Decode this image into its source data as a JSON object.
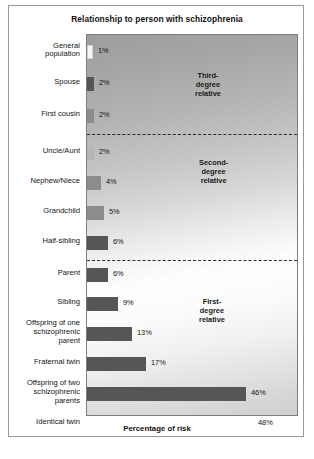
{
  "figure": {
    "title": "Relationship to person with schizophrenia",
    "x_axis_caption": "Percentage of risk"
  },
  "groups": [
    {
      "id": "third-degree",
      "label": "Third-\ndegree\nrelative"
    },
    {
      "id": "second-degree",
      "label": "Second-\ndegree\nrelative"
    },
    {
      "id": "first-degree",
      "label": "First-\ndegree\nrelative"
    }
  ],
  "chart_data": {
    "type": "bar",
    "orientation": "horizontal",
    "title": "Relationship to person with schizophrenia",
    "xlabel": "Percentage of risk",
    "ylabel": "",
    "xlim": [
      0,
      50
    ],
    "grid": false,
    "legend": "none",
    "value_suffix": "%",
    "categories": [
      "General population",
      "Spouse",
      "First cousin",
      "Uncle/Aunt",
      "Nephew/Niece",
      "Grandchild",
      "Half-sibling",
      "Parent",
      "Sibling",
      "Offspring of one schizophrenic parent",
      "Fraternal twin",
      "Offspring of two schizophrenic parents",
      "Identical twin"
    ],
    "values": [
      1,
      2,
      2,
      2,
      4,
      5,
      6,
      6,
      9,
      13,
      17,
      46,
      48
    ],
    "value_labels": [
      "1%",
      "2%",
      "2%",
      "2%",
      "4%",
      "5%",
      "6%",
      "6%",
      "9%",
      "13%",
      "17%",
      "46%",
      "48%"
    ],
    "group_assignment": [
      "third-degree",
      "third-degree",
      "third-degree",
      "second-degree",
      "second-degree",
      "second-degree",
      "second-degree",
      "first-degree",
      "first-degree",
      "first-degree",
      "first-degree",
      "first-degree",
      "first-degree"
    ],
    "annotations": [
      "Third-degree relative",
      "Second-degree relative",
      "First-degree relative"
    ]
  },
  "bars": [
    {
      "label": "General\npopulation",
      "value_label": "1%",
      "shade": "white"
    },
    {
      "label": "Spouse",
      "value_label": "2%",
      "shade": "dark"
    },
    {
      "label": "First cousin",
      "value_label": "2%",
      "shade": "mid"
    },
    {
      "label": "Uncle/Aunt",
      "value_label": "2%",
      "shade": "light"
    },
    {
      "label": "Nephew/Niece",
      "value_label": "4%",
      "shade": "mid"
    },
    {
      "label": "Grandchild",
      "value_label": "5%",
      "shade": "mid"
    },
    {
      "label": "Half-sibling",
      "value_label": "6%",
      "shade": "dark"
    },
    {
      "label": "Parent",
      "value_label": "6%",
      "shade": "dark"
    },
    {
      "label": "Sibling",
      "value_label": "9%",
      "shade": "dark"
    },
    {
      "label": "Offspring of one\nschizophrenic\nparent",
      "value_label": "13%",
      "shade": "dark"
    },
    {
      "label": "Fraternal twin",
      "value_label": "17%",
      "shade": "dark"
    },
    {
      "label": "Offspring of two\nschizophrenic\nparents",
      "value_label": "46%",
      "shade": "dark"
    },
    {
      "label": "Identical twin",
      "value_label": "48%",
      "shade": "black"
    }
  ],
  "colors": {
    "frame": "#9a9a9a",
    "bar_dark": "#565656",
    "bar_mid": "#8c8c8c",
    "bar_light": "#b6b6b6",
    "bar_black": "#0b0b0b",
    "bar_white": "#f6f6f6"
  }
}
